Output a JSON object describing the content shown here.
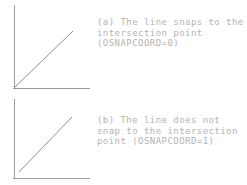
{
  "figure_a": {
    "id": "a",
    "lines": [
      "(a) The line snaps to the",
      "intersection point",
      "(OSNAPCOORD=0)"
    ]
  },
  "figure_b": {
    "id": "b",
    "lines": [
      "(b) The line does not",
      "snap to the intersection",
      "point (OSNAPCOORD=1)"
    ]
  },
  "colors": {
    "axis_line": "#9a9a9a",
    "diagonal_line": "#8f8f8f",
    "caption_text": "#b3b3b3",
    "background": "#ffffff"
  }
}
